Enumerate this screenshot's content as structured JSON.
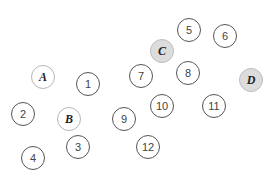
{
  "diagram": {
    "type": "scattered-node-labels",
    "nodes": [
      {
        "id": "A",
        "label": "A",
        "kind": "letter",
        "filled": false,
        "x": 43,
        "y": 77
      },
      {
        "id": "B",
        "label": "B",
        "kind": "letter",
        "filled": false,
        "x": 69,
        "y": 119
      },
      {
        "id": "C",
        "label": "C",
        "kind": "letter",
        "filled": true,
        "x": 162,
        "y": 51
      },
      {
        "id": "D",
        "label": "D",
        "kind": "letter",
        "filled": true,
        "x": 251,
        "y": 80
      },
      {
        "id": "1",
        "label": "1",
        "kind": "number",
        "filled": false,
        "x": 88,
        "y": 84
      },
      {
        "id": "2",
        "label": "2",
        "kind": "number",
        "filled": false,
        "x": 23,
        "y": 114
      },
      {
        "id": "3",
        "label": "3",
        "kind": "number",
        "filled": false,
        "x": 78,
        "y": 147
      },
      {
        "id": "4",
        "label": "4",
        "kind": "number",
        "filled": false,
        "x": 33,
        "y": 158
      },
      {
        "id": "5",
        "label": "5",
        "kind": "number",
        "filled": false,
        "x": 189,
        "y": 30
      },
      {
        "id": "6",
        "label": "6",
        "kind": "number",
        "filled": false,
        "x": 225,
        "y": 36
      },
      {
        "id": "7",
        "label": "7",
        "kind": "number",
        "filled": false,
        "x": 141,
        "y": 76
      },
      {
        "id": "8",
        "label": "8",
        "kind": "number",
        "filled": false,
        "x": 188,
        "y": 73
      },
      {
        "id": "9",
        "label": "9",
        "kind": "number",
        "filled": false,
        "x": 124,
        "y": 119
      },
      {
        "id": "10",
        "label": "10",
        "kind": "number",
        "filled": false,
        "x": 162,
        "y": 106
      },
      {
        "id": "11",
        "label": "11",
        "kind": "number",
        "filled": false,
        "x": 214,
        "y": 106
      },
      {
        "id": "12",
        "label": "12",
        "kind": "number",
        "filled": false,
        "x": 148,
        "y": 147
      }
    ],
    "colors": {
      "background": "#ffffff",
      "number_border": "#555555",
      "letter_border": "#b5b5b5",
      "filled_background": "#dcdcdc",
      "text": "#333333"
    }
  }
}
